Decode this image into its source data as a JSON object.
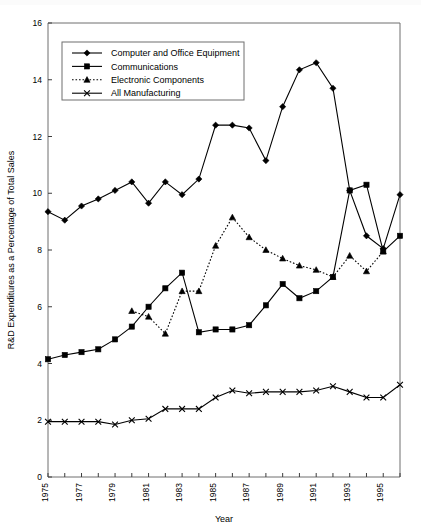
{
  "chart_data": {
    "type": "line",
    "title": "",
    "xlabel": "Year",
    "ylabel": "R&D Expenditures as a Percentage of Total Sales",
    "xlim": [
      1975,
      1996
    ],
    "ylim": [
      0,
      16
    ],
    "yticks": [
      0,
      2,
      4,
      6,
      8,
      10,
      12,
      14,
      16
    ],
    "ytick_labels": [
      "0",
      "2",
      "4",
      "6",
      "8",
      "10",
      "12",
      "14",
      "16"
    ],
    "xticks": [
      1975,
      1977,
      1979,
      1981,
      1983,
      1985,
      1987,
      1989,
      1991,
      1993,
      1995
    ],
    "xtick_labels": [
      "1975",
      "1977",
      "1979",
      "1981",
      "1983",
      "1985",
      "1987",
      "1989",
      "1991",
      "1993",
      "1995"
    ],
    "x": [
      1975,
      1976,
      1977,
      1978,
      1979,
      1980,
      1981,
      1982,
      1983,
      1984,
      1985,
      1986,
      1987,
      1988,
      1989,
      1990,
      1991,
      1992,
      1993,
      1994,
      1995,
      1996
    ],
    "grid": false,
    "legend_position": "upper-left",
    "series": [
      {
        "name": "Computer and Office Equipment",
        "marker": "diamond",
        "linestyle": "solid",
        "color": "#000000",
        "values": [
          9.35,
          9.05,
          9.55,
          9.8,
          10.1,
          10.4,
          9.65,
          10.4,
          9.95,
          10.5,
          12.4,
          12.4,
          12.3,
          11.15,
          13.05,
          14.35,
          14.6,
          13.7,
          10.1,
          8.5,
          8.05,
          9.95
        ]
      },
      {
        "name": "Communications",
        "marker": "square",
        "linestyle": "solid",
        "color": "#000000",
        "values": [
          4.15,
          4.3,
          4.4,
          4.5,
          4.85,
          5.3,
          6.0,
          6.65,
          7.2,
          5.1,
          5.2,
          5.2,
          5.35,
          6.05,
          6.8,
          6.3,
          6.55,
          7.05,
          10.1,
          10.3,
          7.95,
          8.5
        ]
      },
      {
        "name": "Electronic Components",
        "marker": "triangle",
        "linestyle": "dotted",
        "color": "#000000",
        "values": [
          null,
          null,
          null,
          null,
          null,
          5.85,
          5.65,
          5.05,
          6.55,
          6.55,
          8.15,
          9.15,
          8.45,
          8.0,
          7.7,
          7.45,
          7.3,
          7.05,
          7.8,
          7.25,
          7.95,
          null
        ]
      },
      {
        "name": "All Manufacturing",
        "marker": "x",
        "linestyle": "solid",
        "color": "#000000",
        "values": [
          1.95,
          1.95,
          1.95,
          1.95,
          1.85,
          2.0,
          2.05,
          2.4,
          2.4,
          2.4,
          2.8,
          3.05,
          2.95,
          3.0,
          3.0,
          3.0,
          3.05,
          3.2,
          3.0,
          2.8,
          2.8,
          3.25
        ]
      }
    ]
  },
  "legend": {
    "items": [
      {
        "label": "Computer and Office Equipment"
      },
      {
        "label": "Communications"
      },
      {
        "label": "Electronic Components"
      },
      {
        "label": "All Manufacturing"
      }
    ]
  }
}
